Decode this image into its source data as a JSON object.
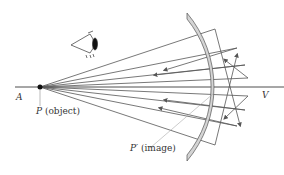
{
  "diagram": {
    "labels": {
      "axis_left": "A",
      "axis_right": "V",
      "object_letter": "P",
      "object_text": "(object)",
      "image_letter": "P′",
      "image_text": "(image)"
    },
    "elements": [
      "eye-icon",
      "principal-axis",
      "concave-mirror",
      "object-point",
      "rays"
    ],
    "colors": {
      "mirror_fill": "#d4d4d4",
      "mirror_stroke": "#555555",
      "ray": "#555555",
      "axis": "#222222"
    }
  }
}
